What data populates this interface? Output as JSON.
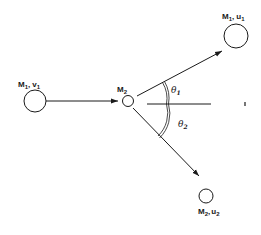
{
  "diagram": {
    "type": "elastic-collision-scattering",
    "colors": {
      "stroke": "#1a1a1a",
      "background": "#ffffff"
    },
    "bodies": [
      {
        "id": "incoming",
        "mass": "M",
        "mass_sub": "1",
        "vel": "v",
        "vel_sub": "1",
        "cx": 35,
        "cy": 101,
        "r": 11
      },
      {
        "id": "target",
        "mass": "M",
        "mass_sub": "2",
        "cx": 128,
        "cy": 101,
        "r": 6
      },
      {
        "id": "scattered-1",
        "mass": "M",
        "mass_sub": "1",
        "vel": "u",
        "vel_sub": "1",
        "cx": 236,
        "cy": 36,
        "r": 12
      },
      {
        "id": "scattered-2",
        "mass": "M",
        "mass_sub": "2",
        "vel": "u",
        "vel_sub": "2",
        "cx": 206,
        "cy": 197,
        "r": 7
      }
    ],
    "angles": [
      {
        "symbol": "θ",
        "sub": "1",
        "meaning": "scattering angle of M1"
      },
      {
        "symbol": "θ",
        "sub": "2",
        "meaning": "recoil angle of M2"
      }
    ],
    "labels": {
      "m1v1_m": "M",
      "m1v1_ms": "1",
      "m1v1_sep": ",",
      "m1v1_v": "v",
      "m1v1_vs": "1",
      "m2_m": "M",
      "m2_ms": "2",
      "m1u1_m": "M",
      "m1u1_ms": "1",
      "m1u1_sep": ",",
      "m1u1_u": "u",
      "m1u1_us": "1",
      "m2u2_m": "M",
      "m2u2_ms": "2",
      "m2u2_sep": ",",
      "m2u2_u": "u",
      "m2u2_us": "2",
      "theta1": "θ",
      "theta1_sub": "1",
      "theta2": "θ",
      "theta2_sub": "2"
    }
  }
}
